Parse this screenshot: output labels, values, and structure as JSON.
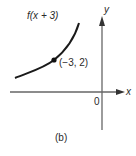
{
  "figure": {
    "function_label": "f(x + 3)",
    "point_label": "(−3, 2)",
    "x_axis_label": "x",
    "y_axis_label": "y",
    "origin_label": "0",
    "caption": "(b)"
  },
  "colors": {
    "curve": "#1a1a1a",
    "axes": "#555555",
    "text": "#2a2a2a"
  }
}
